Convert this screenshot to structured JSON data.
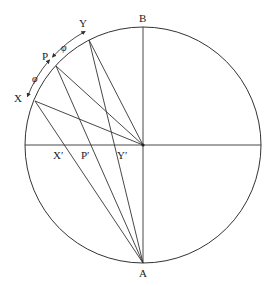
{
  "diagram": {
    "colors": {
      "stroke": "#333333",
      "background": "#ffffff"
    },
    "circle": {
      "cx": 143,
      "cy": 145,
      "r": 118
    },
    "points": {
      "B": {
        "x": 143,
        "y": 27,
        "label": "B"
      },
      "A": {
        "x": 143,
        "y": 263,
        "label": "A"
      },
      "O": {
        "x": 143,
        "y": 145
      },
      "X": {
        "x": 35,
        "y": 101,
        "label": "X"
      },
      "P": {
        "x": 56,
        "y": 66,
        "label": "P"
      },
      "Y": {
        "x": 89,
        "y": 40,
        "label": "Y"
      },
      "X_prime": {
        "x": 72,
        "y": 145,
        "label": "X′"
      },
      "P_prime": {
        "x": 92,
        "y": 145,
        "label": "P′"
      },
      "Y_prime": {
        "x": 115,
        "y": 145,
        "label": "Y′"
      }
    },
    "angle_labels": [
      "φ",
      "φ"
    ]
  }
}
